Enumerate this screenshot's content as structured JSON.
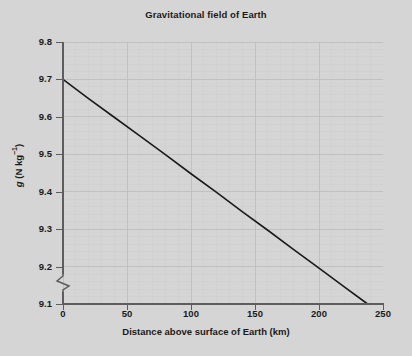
{
  "chart_data": {
    "type": "line",
    "title": "Gravitational field of Earth",
    "xlabel": "Distance above surface of Earth (km)",
    "ylabel": "g (N kg⁻¹)",
    "ylabel_symbol": "g",
    "ylabel_unit": "(N kg",
    "ylabel_exponent": "−1",
    "ylabel_unit_close": ")",
    "xlim": [
      0,
      250
    ],
    "ylim": [
      9.1,
      9.8
    ],
    "y_axis_broken": true,
    "y_axis_break_note": "zigzag break below 9.1",
    "grid": true,
    "grid_major_x_step": 50,
    "grid_major_y_step": 0.1,
    "grid_minor_x_step": 10,
    "grid_minor_y_step": 0.02,
    "legend": null,
    "xticks": [
      0,
      50,
      100,
      150,
      200,
      250
    ],
    "xtick_labels": [
      "0",
      "50",
      "100",
      "150",
      "200",
      "250"
    ],
    "yticks": [
      9.1,
      9.2,
      9.3,
      9.4,
      9.5,
      9.6,
      9.7,
      9.8
    ],
    "ytick_labels": [
      "9.1",
      "9.2",
      "9.3",
      "9.4",
      "9.5",
      "9.6",
      "9.7",
      "9.8"
    ],
    "series": [
      {
        "name": "g vs altitude",
        "color": "#1a1a1a",
        "linewidth": 1.6,
        "x": [
          0,
          20,
          40,
          60,
          80,
          100,
          120,
          140,
          160,
          180,
          200,
          220,
          238
        ],
        "y": [
          9.7,
          9.649,
          9.599,
          9.549,
          9.499,
          9.448,
          9.398,
          9.347,
          9.297,
          9.246,
          9.196,
          9.145,
          9.1
        ]
      }
    ],
    "colors": {
      "background": "#d5d5d5",
      "axis": "#5d5d5d",
      "text": "#1a1a1a",
      "grid_major": "#c4c4c4",
      "grid_minor": "#cfcfcf",
      "line": "#1a1a1a"
    }
  }
}
